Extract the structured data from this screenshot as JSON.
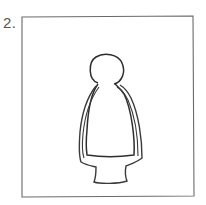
{
  "figure": {
    "number_label": "2.",
    "colors": {
      "stroke": "#3a3a3a",
      "frame": "#6a6a6a",
      "background": "#ffffff"
    }
  }
}
